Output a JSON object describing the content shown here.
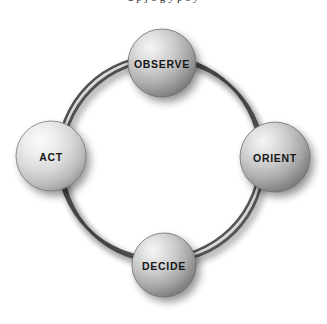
{
  "diagram": {
    "name": "OODA loop cycle diagram",
    "background_color": "#ffffff",
    "ring": {
      "stroke_color": "#4a4a4a",
      "stroke_color_inner": "#5a5a5a",
      "shadow_color": "#b9b9b9",
      "style": "double-ring"
    },
    "sphere_colors": {
      "highlight": "#f2f2f2",
      "midtone": "#c6c6c6",
      "shadow": "#7c7c7c",
      "edge": "#6e6e6e",
      "drop_shadow": "#b0b0b0",
      "label": "#161616"
    },
    "top_cut_text": "a   p   j   o   g       y   p         s   y",
    "nodes": [
      {
        "id": "observe",
        "label": "OBSERVE",
        "position": "top",
        "cx": 162,
        "cy": 63,
        "r": 34,
        "font_size": 10.5,
        "tone": "mid"
      },
      {
        "id": "orient",
        "label": "ORIENT",
        "position": "right",
        "cx": 275,
        "cy": 157,
        "r": 35,
        "font_size": 10.5,
        "tone": "mid"
      },
      {
        "id": "decide",
        "label": "DECIDE",
        "position": "bottom",
        "cx": 164,
        "cy": 265,
        "r": 32,
        "font_size": 10.5,
        "tone": "mid"
      },
      {
        "id": "act",
        "label": "ACT",
        "position": "left",
        "cx": 51,
        "cy": 156,
        "r": 35,
        "font_size": 10.5,
        "tone": "light"
      }
    ]
  }
}
